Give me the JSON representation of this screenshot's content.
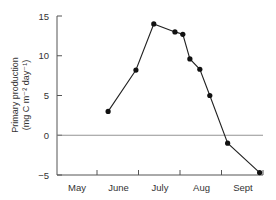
{
  "chart_data": {
    "type": "line",
    "title": "",
    "xlabel": "",
    "ylabel": "Primary production",
    "ylabel_units": "(mg C m⁻² day⁻¹)",
    "ylim": [
      -5,
      15
    ],
    "yticks": [
      15,
      10,
      5,
      0,
      -5
    ],
    "ytick_labels": [
      "15",
      "10",
      "5",
      "0",
      "−5"
    ],
    "x_categories": [
      "May",
      "June",
      "July",
      "Aug",
      "Sept"
    ],
    "grid": false,
    "reference_line": 0,
    "legend": null,
    "series": [
      {
        "name": "Primary production",
        "marker": "filled-circle",
        "points": [
          {
            "month_pos": 0.75,
            "y": 3.0
          },
          {
            "month_pos": 1.42,
            "y": 8.2
          },
          {
            "month_pos": 1.85,
            "y": 14.0
          },
          {
            "month_pos": 2.36,
            "y": 13.0
          },
          {
            "month_pos": 2.55,
            "y": 12.7
          },
          {
            "month_pos": 2.72,
            "y": 9.6
          },
          {
            "month_pos": 2.96,
            "y": 8.3
          },
          {
            "month_pos": 3.2,
            "y": 5.0
          },
          {
            "month_pos": 3.63,
            "y": -1.0
          },
          {
            "month_pos": 4.4,
            "y": -4.7
          }
        ]
      }
    ]
  },
  "colors": {
    "axis": "#555555",
    "line": "#222222",
    "marker": "#111111",
    "zero_line": "#888888",
    "text": "#333333"
  }
}
